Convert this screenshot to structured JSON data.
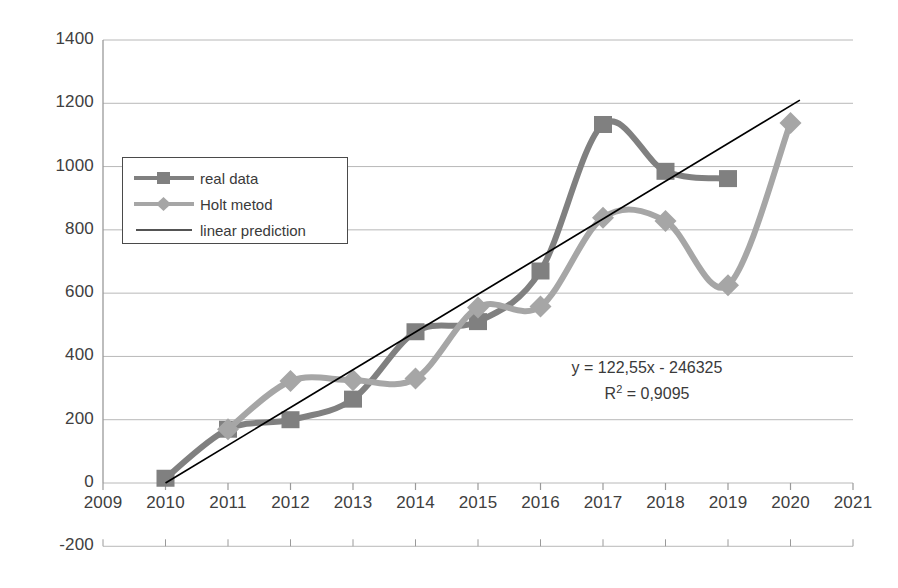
{
  "chart_data": {
    "type": "line",
    "title": "",
    "xlabel": "",
    "ylabel": "",
    "x": [
      2009,
      2010,
      2011,
      2012,
      2013,
      2014,
      2015,
      2016,
      2017,
      2018,
      2019,
      2020,
      2021
    ],
    "xlim": [
      2009,
      2021
    ],
    "ylim": [
      -200,
      1400
    ],
    "ytick_step": 200,
    "grid": true,
    "legend_position": "upper-left",
    "xticks": [
      "2009",
      "2010",
      "2011",
      "2012",
      "2013",
      "2014",
      "2015",
      "2016",
      "2017",
      "2018",
      "2019",
      "2020",
      "2021"
    ],
    "yticks": [
      "-200",
      "0",
      "200",
      "400",
      "600",
      "800",
      "1000",
      "1200",
      "1400"
    ],
    "series": [
      {
        "name": "real data",
        "color": "#808080",
        "marker": "square",
        "smooth": true,
        "points": [
          {
            "x": 2010,
            "y": 15
          },
          {
            "x": 2011,
            "y": 170
          },
          {
            "x": 2012,
            "y": 200
          },
          {
            "x": 2013,
            "y": 265
          },
          {
            "x": 2014,
            "y": 478
          },
          {
            "x": 2015,
            "y": 510
          },
          {
            "x": 2016,
            "y": 670
          },
          {
            "x": 2017,
            "y": 1133
          },
          {
            "x": 2018,
            "y": 985
          },
          {
            "x": 2019,
            "y": 962
          }
        ]
      },
      {
        "name": "Holt metod",
        "color": "#a6a6a6",
        "marker": "diamond",
        "smooth": true,
        "points": [
          {
            "x": 2011,
            "y": 170
          },
          {
            "x": 2012,
            "y": 322
          },
          {
            "x": 2013,
            "y": 325
          },
          {
            "x": 2014,
            "y": 330
          },
          {
            "x": 2015,
            "y": 555
          },
          {
            "x": 2016,
            "y": 558
          },
          {
            "x": 2017,
            "y": 838
          },
          {
            "x": 2018,
            "y": 828
          },
          {
            "x": 2019,
            "y": 625
          },
          {
            "x": 2020,
            "y": 1138
          }
        ]
      },
      {
        "name": "linear prediction",
        "color": "#000000",
        "marker": "none",
        "smooth": false,
        "points": [
          {
            "x": 2010,
            "y": 0
          },
          {
            "x": 2020.15,
            "y": 1210
          }
        ]
      }
    ],
    "annotations": [
      {
        "text": "y = 122,55x - 246325",
        "x": 2017.2,
        "y": 420
      },
      {
        "text": "R² = 0,9095",
        "x": 2017.2,
        "y": 330
      }
    ]
  },
  "equation": {
    "line1": "y = 122,55x - 246325",
    "r_squared_prefix": "R",
    "r_squared_sup": "2",
    "r_squared_value": " = 0,9095"
  },
  "legend": {
    "items": [
      {
        "label": "real data",
        "icon": "square-marker-line-icon"
      },
      {
        "label": "Holt metod",
        "icon": "diamond-marker-line-icon"
      },
      {
        "label": "linear prediction",
        "icon": "plain-line-icon"
      }
    ]
  },
  "colors": {
    "real_data": "#808080",
    "holt": "#a6a6a6",
    "linear": "#000000",
    "gridline": "#b8b8b8",
    "axis": "#9a9a9a",
    "text": "#3a3a3a"
  }
}
